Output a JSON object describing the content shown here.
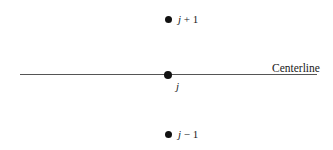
{
  "diagram": {
    "centerline": {
      "label": "Centerline"
    },
    "nodes": [
      {
        "id": "j_plus_1",
        "var": "j",
        "suffix": " + 1"
      },
      {
        "id": "j",
        "var": "j",
        "suffix": ""
      },
      {
        "id": "j_minus_1",
        "var": "j",
        "suffix": " − 1"
      }
    ],
    "colors": {
      "line": "#555555",
      "dot": "#111111",
      "text": "#1a1a1a",
      "background": "#ffffff"
    }
  }
}
